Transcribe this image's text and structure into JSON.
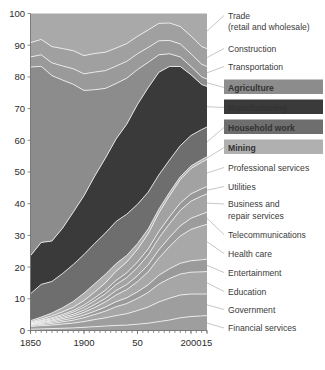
{
  "chart_data": {
    "type": "area",
    "title": "",
    "subtitle": "",
    "xlabel": "",
    "ylabel": "",
    "stacked": true,
    "normalized": true,
    "grid": false,
    "legend_position": "right-annotations",
    "xlim": [
      1850,
      2015
    ],
    "ylim": [
      0,
      100
    ],
    "x": [
      1850,
      1860,
      1870,
      1880,
      1890,
      1900,
      1910,
      1920,
      1930,
      1940,
      1950,
      1960,
      1970,
      1980,
      1990,
      2000,
      2010,
      2015
    ],
    "xtick_values": [
      1850,
      1900,
      1950,
      2000,
      2015
    ],
    "xtick_labels": [
      "1850",
      "1900",
      "50",
      "2000",
      "15"
    ],
    "ytick_values": [
      0,
      10,
      20,
      30,
      40,
      50,
      60,
      70,
      80,
      90,
      100
    ],
    "ytick_labels": [
      "0",
      "10",
      "20",
      "30",
      "40",
      "50",
      "60",
      "70",
      "80",
      "90",
      "100"
    ],
    "series": [
      {
        "name": "Financial services",
        "color": "#9e9e9e",
        "highlighted": false,
        "values": [
          0.4,
          0.5,
          0.6,
          0.7,
          0.8,
          1.0,
          1.2,
          1.4,
          1.6,
          1.7,
          2.0,
          2.3,
          2.8,
          3.3,
          4.0,
          4.4,
          4.6,
          4.7
        ]
      },
      {
        "name": "Government",
        "color": "#9e9e9e",
        "highlighted": false,
        "values": [
          0.9,
          1.0,
          1.1,
          1.3,
          1.5,
          1.8,
          2.2,
          2.6,
          3.1,
          3.6,
          4.3,
          5.1,
          6.2,
          6.9,
          7.2,
          7.1,
          6.9,
          6.8
        ]
      },
      {
        "name": "Education",
        "color": "#a6a6a6",
        "highlighted": false,
        "values": [
          0.3,
          0.4,
          0.5,
          0.7,
          0.9,
          1.2,
          1.6,
          2.1,
          2.8,
          3.2,
          3.8,
          4.6,
          5.6,
          6.2,
          6.6,
          6.9,
          7.0,
          7.1
        ]
      },
      {
        "name": "Entertainment",
        "color": "#9a9a9a",
        "highlighted": false,
        "values": [
          0.2,
          0.3,
          0.4,
          0.5,
          0.6,
          0.8,
          1.0,
          1.3,
          1.6,
          1.8,
          2.1,
          2.4,
          2.8,
          3.1,
          3.4,
          3.6,
          3.8,
          3.9
        ]
      },
      {
        "name": "Health care",
        "color": "#a8a8a8",
        "highlighted": false,
        "values": [
          0.2,
          0.3,
          0.4,
          0.5,
          0.7,
          0.9,
          1.2,
          1.6,
          2.1,
          2.6,
          3.2,
          4.1,
          5.4,
          7.0,
          8.6,
          9.9,
          10.7,
          11.0
        ]
      },
      {
        "name": "Telecommunications",
        "color": "#9c9c9c",
        "highlighted": false,
        "values": [
          0.1,
          0.2,
          0.3,
          0.4,
          0.5,
          0.7,
          0.9,
          1.1,
          1.4,
          1.6,
          1.9,
          2.2,
          2.6,
          2.9,
          3.2,
          3.5,
          3.7,
          3.8
        ]
      },
      {
        "name": "Business and repair services",
        "color": "#a4a4a4",
        "highlighted": false,
        "values": [
          0.2,
          0.3,
          0.4,
          0.5,
          0.7,
          0.9,
          1.2,
          1.5,
          1.9,
          2.2,
          2.6,
          3.1,
          3.7,
          4.3,
          4.9,
          5.4,
          5.7,
          5.8
        ]
      },
      {
        "name": "Utilities",
        "color": "#989898",
        "highlighted": false,
        "values": [
          0.1,
          0.2,
          0.3,
          0.4,
          0.5,
          0.7,
          0.9,
          1.1,
          1.3,
          1.5,
          1.7,
          1.9,
          2.1,
          2.2,
          2.3,
          2.3,
          2.3,
          2.3
        ]
      },
      {
        "name": "Professional services",
        "color": "#a2a2a2",
        "highlighted": false,
        "values": [
          0.3,
          0.4,
          0.6,
          0.8,
          1.0,
          1.4,
          1.8,
          2.3,
          2.9,
          3.4,
          4.0,
          4.8,
          5.8,
          6.6,
          7.4,
          8.0,
          8.4,
          8.6
        ]
      },
      {
        "name": "Mining",
        "color": "#b0b0b0",
        "highlighted": true,
        "values": [
          0.4,
          0.6,
          0.9,
          1.3,
          1.8,
          2.3,
          2.6,
          2.7,
          2.4,
          2.1,
          1.8,
          1.5,
          1.2,
          1.1,
          0.9,
          0.8,
          0.8,
          0.8
        ]
      },
      {
        "name": "Household work",
        "color": "#6e6e6e",
        "highlighted": true,
        "values": [
          8.5,
          10.2,
          9.9,
          10.6,
          11.4,
          12.1,
          12.6,
          13.0,
          13.3,
          13.0,
          12.4,
          11.6,
          10.8,
          10.2,
          9.8,
          9.6,
          9.5,
          9.4
        ]
      },
      {
        "name": "Manufacturing",
        "color": "#3a3a3a",
        "highlighted": true,
        "values": [
          12.0,
          13.1,
          12.7,
          14.1,
          16.2,
          18.4,
          21.0,
          23.6,
          26.0,
          28.4,
          31.5,
          32.9,
          32.3,
          29.5,
          25.0,
          19.2,
          14.2,
          12.8
        ]
      },
      {
        "name": "Agriculture",
        "color": "#8c8c8c",
        "highlighted": true,
        "values": [
          59.5,
          55.0,
          52.0,
          46.0,
          39.5,
          33.0,
          27.0,
          22.0,
          17.5,
          14.5,
          11.0,
          8.0,
          5.5,
          4.0,
          3.0,
          2.6,
          2.4,
          2.3
        ]
      },
      {
        "name": "Transportation",
        "color": "#9a9a9a",
        "highlighted": false,
        "values": [
          3.2,
          3.6,
          4.0,
          4.4,
          4.8,
          5.2,
          5.5,
          5.6,
          5.5,
          5.3,
          5.0,
          4.7,
          4.4,
          4.2,
          4.1,
          4.0,
          4.0,
          4.0
        ]
      },
      {
        "name": "Construction",
        "color": "#a0a0a0",
        "highlighted": false,
        "values": [
          4.5,
          4.8,
          5.1,
          5.4,
          5.6,
          5.7,
          5.8,
          5.8,
          5.7,
          5.6,
          5.5,
          5.5,
          5.5,
          5.5,
          5.5,
          5.6,
          5.6,
          5.6
        ]
      },
      {
        "name": "Trade (retail and wholesale)",
        "color": "#a9a9a9",
        "highlighted": false,
        "values": [
          9.2,
          8.1,
          10.4,
          10.9,
          11.5,
          13.2,
          12.5,
          12.2,
          10.9,
          9.5,
          7.2,
          5.2,
          3.1,
          3.0,
          4.1,
          7.1,
          10.4,
          11.1
        ]
      }
    ],
    "annotations": [
      {
        "label": "Trade",
        "label2": "(retail and wholesale)",
        "highlighted": false
      },
      {
        "label": "Construction",
        "highlighted": false
      },
      {
        "label": "Transportation",
        "highlighted": false
      },
      {
        "label": "Agriculture",
        "highlighted": true,
        "box_color": "#8c8c8c",
        "text_color": "#ffffff"
      },
      {
        "label": "Manufacturing",
        "highlighted": true,
        "box_color": "#3a3a3a",
        "text_color": "#ffffff"
      },
      {
        "label": "Household work",
        "highlighted": true,
        "box_color": "#6e6e6e",
        "text_color": "#ffffff"
      },
      {
        "label": "Mining",
        "highlighted": true,
        "box_color": "#b0b0b0",
        "text_color": "#ffffff"
      },
      {
        "label": "Professional services",
        "highlighted": false
      },
      {
        "label": "Utilities",
        "highlighted": false
      },
      {
        "label": "Business and",
        "label2": "repair services",
        "highlighted": false
      },
      {
        "label": "Telecommunications",
        "highlighted": false
      },
      {
        "label": "Health care",
        "highlighted": false
      },
      {
        "label": "Entertainment",
        "highlighted": false
      },
      {
        "label": "Education",
        "highlighted": false
      },
      {
        "label": "Government",
        "highlighted": false
      },
      {
        "label": "Financial services",
        "highlighted": false
      }
    ]
  },
  "axis": {
    "y_labels": [
      "100",
      "90",
      "80",
      "70",
      "60",
      "50",
      "40",
      "30",
      "20",
      "10",
      "0"
    ],
    "x_labels": [
      "1850",
      "1900",
      "50",
      "2000",
      "15"
    ]
  },
  "labels": {
    "trade_line1": "Trade",
    "trade_line2": "(retail and wholesale)",
    "construction": "Construction",
    "transportation": "Transportation",
    "agriculture": "Agriculture",
    "manufacturing": "Manufacturing",
    "household_work": "Household work",
    "mining": "Mining",
    "professional_services": "Professional services",
    "utilities": "Utilities",
    "business_line1": "Business and",
    "business_line2": "repair services",
    "telecommunications": "Telecommunications",
    "health_care": "Health care",
    "entertainment": "Entertainment",
    "education": "Education",
    "government": "Government",
    "financial_services": "Financial services"
  }
}
